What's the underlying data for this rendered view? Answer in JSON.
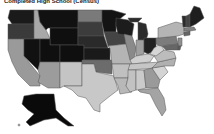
{
  "title": "Completed High School (Census)",
  "map": {
    "type": "choropleth",
    "region": "United States",
    "palette": "grayscale",
    "legend_visible": false,
    "states": [
      {
        "id": "WA",
        "fill": "#1a1a1a"
      },
      {
        "id": "OR",
        "fill": "#3a3a3a"
      },
      {
        "id": "CA",
        "fill": "#9a9a9a"
      },
      {
        "id": "ID",
        "fill": "#a8a8a8"
      },
      {
        "id": "NV",
        "fill": "#111111"
      },
      {
        "id": "MT",
        "fill": "#111111"
      },
      {
        "id": "WY",
        "fill": "#0f0f0f"
      },
      {
        "id": "UT",
        "fill": "#0f0f0f"
      },
      {
        "id": "CO",
        "fill": "#0f0f0f"
      },
      {
        "id": "AZ",
        "fill": "#9c9c9c"
      },
      {
        "id": "NM",
        "fill": "#c4c4c4"
      },
      {
        "id": "ND",
        "fill": "#7a7a7a"
      },
      {
        "id": "SD",
        "fill": "#3c3c3c"
      },
      {
        "id": "NE",
        "fill": "#2a2a2a"
      },
      {
        "id": "KS",
        "fill": "#1a1a1a"
      },
      {
        "id": "OK",
        "fill": "#6c6c6c"
      },
      {
        "id": "TX",
        "fill": "#c8c8c8"
      },
      {
        "id": "MN",
        "fill": "#141414"
      },
      {
        "id": "IA",
        "fill": "#444444"
      },
      {
        "id": "MO",
        "fill": "#b4b4b4"
      },
      {
        "id": "AR",
        "fill": "#c0c0c0"
      },
      {
        "id": "LA",
        "fill": "#b8b8b8"
      },
      {
        "id": "WI",
        "fill": "#1c1c1c"
      },
      {
        "id": "IL",
        "fill": "#8a8a8a"
      },
      {
        "id": "MI",
        "fill": "#2c2c2c"
      },
      {
        "id": "IN",
        "fill": "#a0a0a0"
      },
      {
        "id": "OH",
        "fill": "#222222"
      },
      {
        "id": "KY",
        "fill": "#d0d0d0"
      },
      {
        "id": "TN",
        "fill": "#c6c6c6"
      },
      {
        "id": "MS",
        "fill": "#c2c2c2"
      },
      {
        "id": "AL",
        "fill": "#cacaca"
      },
      {
        "id": "GA",
        "fill": "#9a9a9a"
      },
      {
        "id": "FL",
        "fill": "#a4a4a4"
      },
      {
        "id": "SC",
        "fill": "#d4d4d4"
      },
      {
        "id": "NC",
        "fill": "#b0b0b0"
      },
      {
        "id": "VA",
        "fill": "#bcbcbc"
      },
      {
        "id": "WV",
        "fill": "#d6d6d6"
      },
      {
        "id": "PA",
        "fill": "#7c7c7c"
      },
      {
        "id": "NY",
        "fill": "#b4b4b4"
      },
      {
        "id": "NJ",
        "fill": "#909090"
      },
      {
        "id": "MD",
        "fill": "#666666"
      },
      {
        "id": "DE",
        "fill": "#5a5a5a"
      },
      {
        "id": "CT",
        "fill": "#666666"
      },
      {
        "id": "MA",
        "fill": "#808080"
      },
      {
        "id": "VT",
        "fill": "#2a2a2a"
      },
      {
        "id": "NH",
        "fill": "#444444"
      },
      {
        "id": "ME",
        "fill": "#1e1e1e"
      },
      {
        "id": "AK",
        "fill": "#0a0a0a"
      },
      {
        "id": "HI",
        "fill": "#bbbbbb"
      }
    ]
  }
}
